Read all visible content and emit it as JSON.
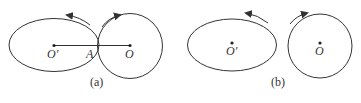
{
  "panels": [
    {
      "caption": "(a)",
      "ellipse_label": "O′",
      "circle_label": "O",
      "contact_label": "A"
    },
    {
      "caption": "(b)",
      "ellipse_label": "O′",
      "circle_label": "O"
    }
  ],
  "colors": {
    "stroke": "#333333",
    "background": "#ffffff"
  }
}
